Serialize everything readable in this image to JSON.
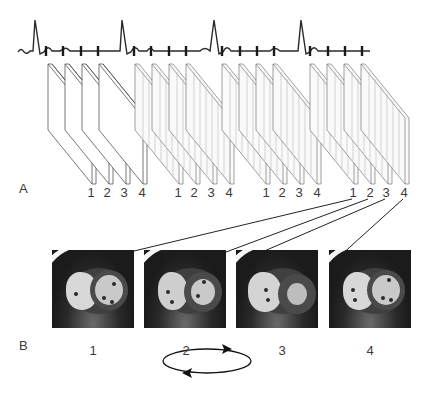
{
  "figure": {
    "panel_a_label": "A",
    "panel_b_label": "B",
    "ecg": {
      "description": "ECG trace with 4 R-peaks; each cardiac cycle divided by 4 trigger ticks",
      "cycles": 4,
      "ticks_per_cycle": 4
    },
    "stacks": [
      {
        "index": 1,
        "labels": [
          "1",
          "2",
          "3",
          "4"
        ]
      },
      {
        "index": 2,
        "labels": [
          "1",
          "2",
          "3",
          "4"
        ]
      },
      {
        "index": 3,
        "labels": [
          "1",
          "2",
          "3",
          "4"
        ]
      },
      {
        "index": 4,
        "labels": [
          "1",
          "2",
          "3",
          "4"
        ]
      }
    ],
    "images": [
      {
        "label": "1",
        "caption": "1"
      },
      {
        "label": "2",
        "caption": "2"
      },
      {
        "label": "3",
        "caption": "3"
      },
      {
        "label": "4",
        "caption": "4"
      }
    ],
    "cycle_icon": "circular-arrows-loop-icon"
  }
}
